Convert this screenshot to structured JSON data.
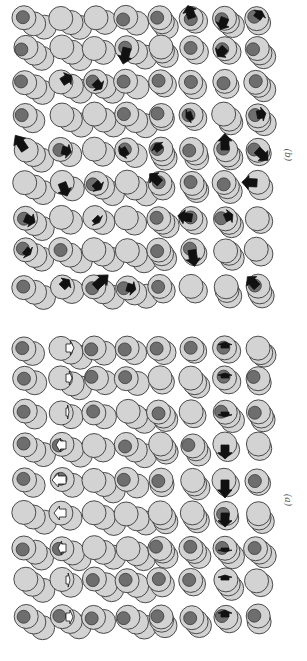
{
  "figure": {
    "orientation": "rotated-90",
    "colors": {
      "disk_light": "#d3d3d3",
      "disk_dark": "#6e6e6e",
      "outline": "#3a3a3a",
      "arrow_dark": "#111111",
      "arrow_white": "#ffffff"
    },
    "panels": [
      {
        "id": "b",
        "label": "(b)",
        "rows": 9,
        "cols": 8,
        "arrow_style": "black, random directions"
      },
      {
        "id": "a",
        "label": "(a)",
        "rows": 9,
        "cols": 8,
        "arrow_style": "white arrows in column 2, black arrows in column 7"
      }
    ]
  }
}
